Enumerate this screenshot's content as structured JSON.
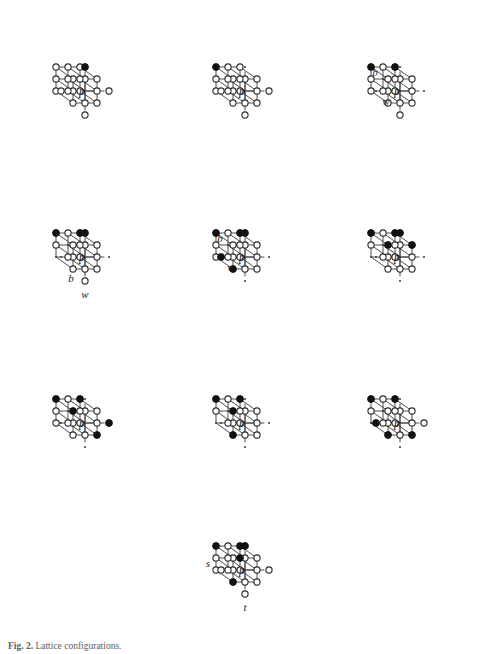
{
  "figure": {
    "caption_label": "Fig. 2.",
    "caption_text": "Lattice configurations.",
    "center_label": "p",
    "canvas": {
      "width": 478,
      "height": 654
    },
    "projection": {
      "step_x": 24,
      "step_y": 24,
      "depth_dx": -17,
      "depth_dy": -12,
      "axis_overshoot": 1.62
    },
    "node_styles": {
      "open": "open-circle",
      "filled": "filled-circle",
      "tiny": "tiny-dot"
    },
    "colors": {
      "line": "#3b3b3b",
      "node_stroke": "#2b2b2b",
      "node_fill_open": "#ffffff",
      "node_fill_closed": "#111111",
      "text": "#1a1a1a",
      "background": "#ffffff"
    },
    "panels": [
      {
        "id": "panel-1",
        "row": 1,
        "col": 1,
        "left": 6,
        "top": 12,
        "width": 158,
        "height": 158,
        "filled_nodes": [
          "0,2,0"
        ],
        "tiny_nodes": [],
        "labels": []
      },
      {
        "id": "panel-2",
        "row": 1,
        "col": 2,
        "left": 166,
        "top": 12,
        "width": 158,
        "height": 158,
        "filled_nodes": [
          "-1,1,1"
        ],
        "tiny_nodes": [
          "0,2,0"
        ],
        "labels": []
      },
      {
        "id": "panel-3",
        "row": 1,
        "col": 3,
        "left": 324,
        "top": 12,
        "width": 152,
        "height": 158,
        "filled_nodes": [
          "-1,1,1",
          "1,1,1"
        ],
        "tiny_nodes": [
          "0,2,0",
          "-2,0,0",
          "2,0,0",
          "0,0,1"
        ],
        "labels": [
          {
            "text": "b",
            "node": "-1,1,0",
            "dx": -13,
            "dy": -3
          },
          {
            "text": "w",
            "node": "-1,0,0",
            "dx": -2,
            "dy": 14
          }
        ]
      },
      {
        "id": "panel-4",
        "row": 2,
        "col": 1,
        "left": 6,
        "top": 178,
        "width": 158,
        "height": 158,
        "filled_nodes": [
          "0,2,0",
          "-1,1,1",
          "1,1,1"
        ],
        "tiny_nodes": [
          "-2,0,0",
          "2,0,0",
          "0,0,1",
          "-1,-1,1"
        ],
        "labels": [
          {
            "text": "b",
            "node": "-1,-1,0",
            "dx": -2,
            "dy": 13
          },
          {
            "text": "w",
            "node": "0,-2,0",
            "dx": 0,
            "dy": 17
          }
        ]
      },
      {
        "id": "panel-5",
        "row": 2,
        "col": 2,
        "left": 166,
        "top": 178,
        "width": 158,
        "height": 158,
        "filled_nodes": [
          "0,2,0",
          "-1,1,1",
          "1,1,1",
          "-2,0,0",
          "-1,-1,0"
        ],
        "tiny_nodes": [
          "2,0,0",
          "0,0,1",
          "0,-2,0"
        ],
        "labels": [
          {
            "text": "b",
            "node": "-1,1,0",
            "dx": -13,
            "dy": -3
          },
          {
            "text": "w",
            "node": "-1,0,0",
            "dx": -2,
            "dy": 14
          }
        ]
      },
      {
        "id": "panel-6",
        "row": 2,
        "col": 3,
        "left": 324,
        "top": 178,
        "width": 152,
        "height": 158,
        "filled_nodes": [
          "0,2,0",
          "-1,1,1",
          "1,1,1",
          "-1,1,0",
          "1,1,0"
        ],
        "tiny_nodes": [
          "-2,0,0",
          "2,0,0",
          "0,0,1",
          "-1,-1,1",
          "0,-2,0"
        ],
        "labels": []
      },
      {
        "id": "panel-7",
        "row": 3,
        "col": 1,
        "left": 6,
        "top": 344,
        "width": 158,
        "height": 158,
        "filled_nodes": [
          "-1,1,1",
          "1,1,1",
          "-1,1,0",
          "2,0,0",
          "1,-1,0"
        ],
        "tiny_nodes": [
          "0,2,0",
          "-2,0,0",
          "0,0,1",
          "0,-2,0"
        ],
        "labels": []
      },
      {
        "id": "panel-8",
        "row": 3,
        "col": 2,
        "left": 166,
        "top": 344,
        "width": 158,
        "height": 158,
        "filled_nodes": [
          "-1,1,1",
          "1,1,1",
          "-1,1,0",
          "-1,-1,0"
        ],
        "tiny_nodes": [
          "0,2,0",
          "-2,0,0",
          "2,0,0",
          "0,0,1",
          "-1,-1,1",
          "0,-2,0"
        ],
        "labels": []
      },
      {
        "id": "panel-9",
        "row": 3,
        "col": 3,
        "left": 324,
        "top": 344,
        "width": 152,
        "height": 158,
        "filled_nodes": [
          "-1,1,1",
          "1,1,1",
          "-2,0,0",
          "-1,-1,0",
          "1,-1,0"
        ],
        "tiny_nodes": [
          "0,2,0",
          "0,0,1",
          "-1,-1,1",
          "0,-2,0"
        ],
        "labels": []
      },
      {
        "id": "panel-10",
        "row": 4,
        "col": 2,
        "left": 166,
        "top": 490,
        "width": 158,
        "height": 160,
        "filled_nodes": [
          "0,2,0",
          "-1,1,1",
          "1,1,1",
          "1,0,1",
          "2,-1,0",
          "-1,-1,0"
        ],
        "tiny_nodes": [],
        "labels": [
          {
            "text": "s",
            "node": "-2,0,0",
            "dx": -13,
            "dy": -3
          },
          {
            "text": "t",
            "node": "0,-2,0",
            "dx": 0,
            "dy": 17
          }
        ]
      }
    ]
  }
}
